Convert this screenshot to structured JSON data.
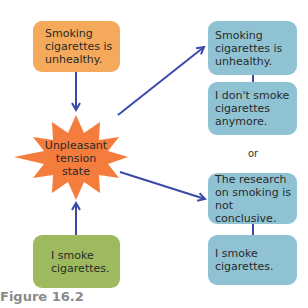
{
  "diagram": {
    "left_top_box": {
      "text": "Smoking\ncigarettes is\nunhealthy.",
      "color": "#f5a95a"
    },
    "center_burst": {
      "text": "Unpleasant\ntension\nstate",
      "color": "#f47c3c"
    },
    "left_bottom_box": {
      "text": "I smoke\ncigarettes.",
      "color": "#9dbb5e"
    },
    "right_option_1": [
      {
        "text": "Smoking\ncigarettes is\nunhealthy."
      },
      {
        "text": "I don't smoke\ncigarettes\nanymore."
      }
    ],
    "separator": "or",
    "right_option_2": [
      {
        "text": "The research\non smoking is\nnot conclusive."
      },
      {
        "text": "I smoke\ncigarettes."
      }
    ],
    "right_box_color": "#8fc3d4",
    "arrow_color": "#3a4aa8"
  },
  "caption": "Figure 16.2"
}
